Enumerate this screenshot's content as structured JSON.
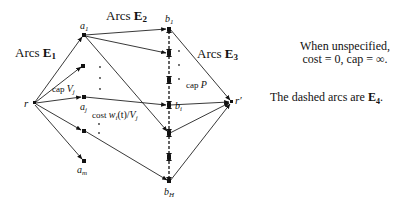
{
  "diagram": {
    "nodes": {
      "r": {
        "label": "r"
      },
      "a1": {
        "label": "a",
        "sub": "1"
      },
      "aj": {
        "label": "a",
        "sub": "j"
      },
      "am": {
        "label": "a",
        "sub": "m"
      },
      "b1": {
        "label": "b",
        "sub": "1"
      },
      "bi": {
        "label": "b",
        "sub": "i"
      },
      "bH": {
        "label": "b",
        "sub": "H"
      },
      "rprime": {
        "label": "r′"
      }
    },
    "arc_labels": {
      "e1_prefix": "Arcs ",
      "e1_bold": "E",
      "e1_sub": "1",
      "e2_prefix": "Arcs ",
      "e2_bold": "E",
      "e2_sub": "2",
      "e3_prefix": "Arcs ",
      "e3_bold": "E",
      "e3_sub": "3"
    },
    "edge_annotations": {
      "cap_v_prefix": "cap ",
      "cap_v_var": "V",
      "cap_v_sub": "j",
      "cost_prefix": "cost ",
      "cost_expr": "w",
      "cost_sub_i": "i",
      "cost_mid": "(t)/",
      "cost_var": "V",
      "cost_sub_j": "j",
      "cap_p_prefix": "cap ",
      "cap_p_var": "P"
    }
  },
  "notes": {
    "default_line1": "When unspecified,",
    "default_line2": "cost = 0, cap = ∞.",
    "dashed_prefix": "The dashed arcs are ",
    "dashed_bold": "E",
    "dashed_sub": "4",
    "dashed_suffix": "."
  }
}
